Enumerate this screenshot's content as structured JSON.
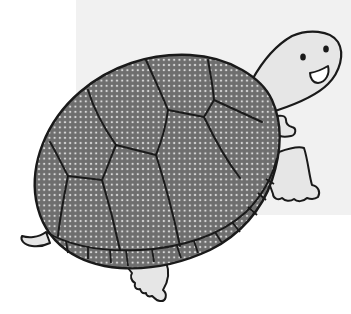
{
  "illustration": {
    "subject": "cartoon turtle",
    "description": "Smiling cartoon turtle walking, with a dotted gray shell",
    "colors": {
      "background": "#ffffff",
      "panel": "#f1f1f1",
      "shell_fill": "#6e6e6e",
      "shell_dots": "#d8d8d8",
      "skin": "#e6e6e6",
      "outline": "#1a1a1a"
    },
    "parts": [
      "shell",
      "head",
      "eyes",
      "smile",
      "front-arm",
      "front-leg",
      "back-foot",
      "tail"
    ]
  }
}
